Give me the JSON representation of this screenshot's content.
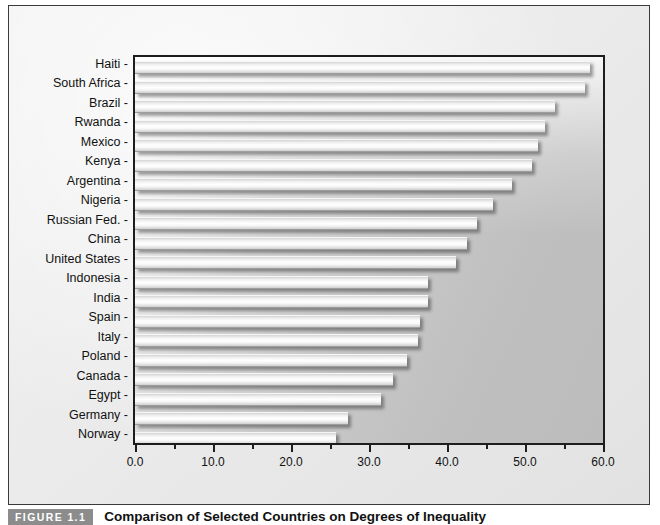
{
  "figure": {
    "label": "FIGURE 1.1",
    "caption": "Comparison of Selected Countries on Degrees of Inequality"
  },
  "chart_data": {
    "type": "bar",
    "orientation": "horizontal",
    "title": "",
    "xlabel": "",
    "ylabel": "",
    "xlim": [
      0.0,
      60.0
    ],
    "grid": false,
    "legend": "none",
    "xticks": [
      "0.0",
      "10.0",
      "20.0",
      "30.0",
      "40.0",
      "50.0",
      "60.0"
    ],
    "xtick_values": [
      0,
      10,
      20,
      30,
      40,
      50,
      60
    ],
    "xminor_values": [
      5,
      15,
      25,
      35,
      45,
      55
    ],
    "categories": [
      "Haiti",
      "South Africa",
      "Brazil",
      "Rwanda",
      "Mexico",
      "Kenya",
      "Argentina",
      "Nigeria",
      "Russian Fed.",
      "China",
      "United States",
      "Indonesia",
      "India",
      "Spain",
      "Italy",
      "Poland",
      "Canada",
      "Egypt",
      "Germany",
      "Norway"
    ],
    "values": [
      58.3,
      57.7,
      53.9,
      52.5,
      51.7,
      50.9,
      48.3,
      45.9,
      43.9,
      42.5,
      41.1,
      37.6,
      37.6,
      36.5,
      36.3,
      34.9,
      33.1,
      31.6,
      27.3,
      25.8
    ]
  },
  "colors": {
    "frame_border": "#3a3a3a",
    "axis": "#1d1d1d",
    "plot_bg": "#c7c7c7",
    "bar_fill": "#ffffff",
    "label_bg": "#8c8c8c",
    "text": "#111111"
  }
}
